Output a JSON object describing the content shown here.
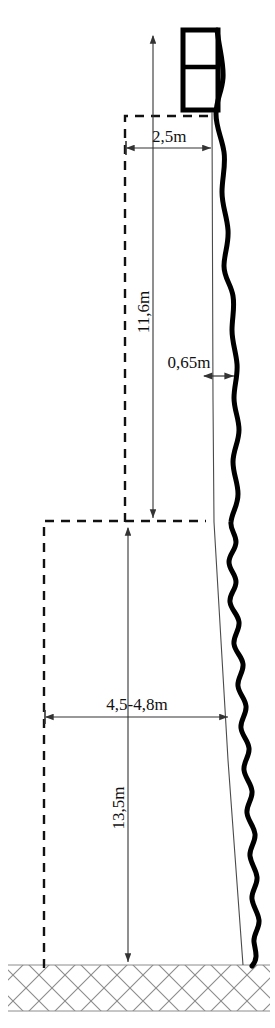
{
  "figure": {
    "type": "technical-cross-section-diagram",
    "title": "",
    "background_color": "#ffffff",
    "line_color": "#000000",
    "hatch_color": "#8c8c8c"
  },
  "dimensions": [
    {
      "id": "top-width",
      "label": "2,5m",
      "orientation": "horizontal",
      "value": 2.5,
      "unit": "m"
    },
    {
      "id": "upper-height",
      "label": "11,6m",
      "orientation": "vertical",
      "value": 11.6,
      "unit": "m"
    },
    {
      "id": "bulge-offset",
      "label": "0,65m",
      "orientation": "horizontal",
      "value": 0.65,
      "unit": "m"
    },
    {
      "id": "base-width",
      "label": "4,5-4,8m",
      "orientation": "horizontal",
      "value_min": 4.5,
      "value_max": 4.8,
      "unit": "m"
    },
    {
      "id": "lower-height",
      "label": "13,5m",
      "orientation": "vertical",
      "value": 13.5,
      "unit": "m"
    }
  ],
  "elements": {
    "top_box": "top-structure-box",
    "profile_curve": "wall-profile-curve",
    "reference_line": "straight-reference-line",
    "upper_outline": "upper-dashed-outline",
    "lower_outline": "lower-dashed-outline",
    "ground": "hatched-ground-band"
  }
}
